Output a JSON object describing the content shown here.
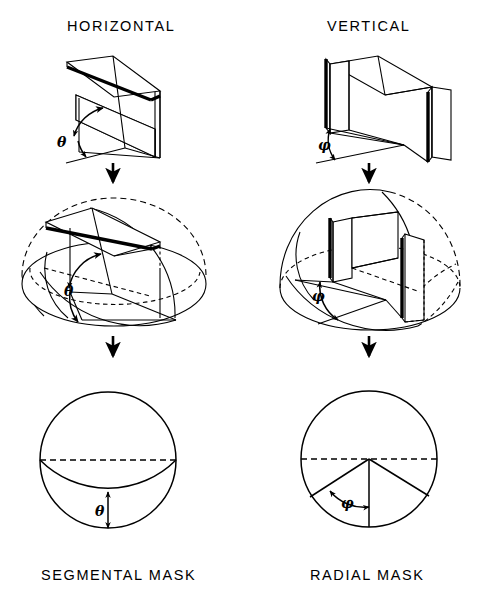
{
  "figure": {
    "background_color": "#ffffff",
    "ink_color": "#000000",
    "columns": [
      {
        "id": "horizontal",
        "title": "HORIZONTAL",
        "angle_symbol": "θ",
        "mask_label": "SEGMENTAL MASK"
      },
      {
        "id": "vertical",
        "title": "VERTICAL",
        "angle_symbol": "φ",
        "mask_label": "RADIAL MASK"
      }
    ],
    "titles": {
      "left": "HORIZONTAL",
      "right": "VERTICAL"
    },
    "mask_labels": {
      "left": "SEGMENTAL MASK",
      "right": "RADIAL MASK"
    },
    "symbols": {
      "theta": "θ",
      "phi": "φ"
    },
    "angle_annotations": [
      {
        "row": 1,
        "column": "horizontal",
        "symbol": "θ",
        "x": 70,
        "y": 143
      },
      {
        "row": 1,
        "column": "vertical",
        "symbol": "φ",
        "x": 320,
        "y": 146
      },
      {
        "row": 2,
        "column": "horizontal",
        "symbol": "θ",
        "x": 72,
        "y": 290
      },
      {
        "row": 2,
        "column": "vertical",
        "symbol": "φ",
        "x": 318,
        "y": 297
      },
      {
        "row": 3,
        "column": "horizontal",
        "symbol": "θ",
        "x": 101,
        "y": 510
      },
      {
        "row": 3,
        "column": "vertical",
        "symbol": "φ",
        "x": 345,
        "y": 501
      }
    ],
    "flow_arrows": [
      {
        "from_row": 1,
        "to_row": 2,
        "column": "horizontal",
        "x": 113,
        "y1": 162,
        "y2": 184
      },
      {
        "from_row": 1,
        "to_row": 2,
        "column": "vertical",
        "x": 369,
        "y1": 162,
        "y2": 184
      },
      {
        "from_row": 2,
        "to_row": 3,
        "column": "horizontal",
        "x": 113,
        "y1": 336,
        "y2": 358
      },
      {
        "from_row": 2,
        "to_row": 3,
        "column": "vertical",
        "x": 369,
        "y1": 336,
        "y2": 358
      }
    ],
    "rows": [
      {
        "index": 1,
        "name": "baffle-geometry"
      },
      {
        "index": 2,
        "name": "hemisphere-projection"
      },
      {
        "index": 3,
        "name": "projected-mask"
      }
    ],
    "masks": {
      "segmental": {
        "circle_center": [
          108,
          460
        ],
        "circle_radius": 68,
        "equator": "dashed-horizontal-diameter",
        "segment_boundary": "solid-arc-below-equator",
        "dimension_arrow": "vertical-double-headed"
      },
      "radial": {
        "circle_center": [
          369,
          459
        ],
        "circle_radius": 68,
        "equator": "dashed-horizontal-diameter",
        "sector_edges": 2,
        "dimension_arrow": "curved-double-headed"
      }
    }
  },
  "icons": {
    "down_arrow": "down-arrow-icon",
    "angle_arc_arrow": "angle-arc-arrow-icon",
    "double_arrow": "double-headed-arrow-icon"
  }
}
